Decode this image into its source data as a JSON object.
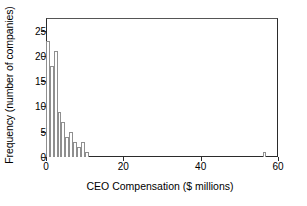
{
  "chart_data": {
    "type": "bar",
    "title": "",
    "subtitle": "",
    "xlabel": "CEO Compensation ($ millions)",
    "ylabel": "Frequency (number of companies)",
    "xlim": [
      0,
      60
    ],
    "ylim": [
      0,
      27.5
    ],
    "grid": false,
    "legend": null,
    "bin_width": 1,
    "xticks": [
      0,
      20,
      40,
      60
    ],
    "yticks": [
      0,
      5,
      10,
      15,
      20,
      25
    ],
    "bin_starts": [
      0,
      1,
      2,
      3,
      4,
      5,
      6,
      7,
      8,
      9,
      10,
      56
    ],
    "categories": [
      "0-1",
      "1-2",
      "2-3",
      "3-4",
      "4-5",
      "5-6",
      "6-7",
      "7-8",
      "8-9",
      "9-10",
      "10-11",
      "56-57"
    ],
    "values": [
      23,
      18,
      21,
      9,
      7,
      4,
      5,
      3,
      2,
      3,
      1,
      1
    ],
    "bar_fill_color": "#ffffff",
    "bar_edge_color": "#8f8f8f",
    "axis_color": "#2b2b2b",
    "background_color": "#ffffff",
    "annotations": []
  },
  "axes": {
    "y_tick_labels": [
      "0",
      "5",
      "10",
      "15",
      "20",
      "25"
    ],
    "x_tick_labels": [
      "0",
      "20",
      "40",
      "60"
    ]
  }
}
